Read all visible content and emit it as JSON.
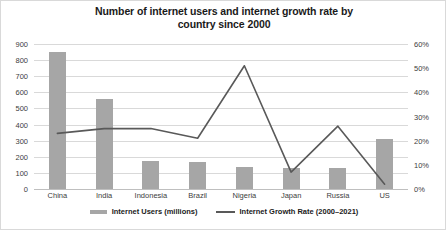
{
  "chart_data": {
    "type": "bar",
    "title": "Number of internet users and internet growth rate by country since 2000",
    "title_line1": "Number of internet users and internet growth rate by",
    "title_line2": "country since 2000",
    "categories": [
      "China",
      "India",
      "Indonesia",
      "Brazil",
      "Nigeria",
      "Japan",
      "Russia",
      "US"
    ],
    "series": [
      {
        "name": "Internet Users (millions)",
        "type": "bar",
        "axis": "left",
        "color": "#a6a6a6",
        "values": [
          850,
          560,
          175,
          165,
          135,
          130,
          130,
          310
        ]
      },
      {
        "name": "Internet Growth Rate (2000–2021)",
        "type": "line",
        "axis": "right",
        "color": "#595959",
        "values": [
          23,
          25,
          25,
          21,
          51,
          7,
          26,
          2
        ]
      }
    ],
    "xlabel": "",
    "ylabel": "",
    "ylim": [
      0,
      900
    ],
    "y_ticks": [
      "0",
      "100",
      "200",
      "300",
      "400",
      "500",
      "600",
      "700",
      "800",
      "900"
    ],
    "y2lim": [
      0,
      60
    ],
    "y2_ticks": [
      "0%",
      "10%",
      "20%",
      "30%",
      "40%",
      "50%",
      "60%"
    ],
    "grid": true,
    "legend_position": "bottom"
  },
  "legend": {
    "items": [
      {
        "label": "Internet Users (millions)"
      },
      {
        "label": "Internet Growth Rate (2000–2021)"
      }
    ]
  },
  "colors": {
    "bar": "#a6a6a6",
    "line": "#595959",
    "gridline": "#d9d9d9",
    "border": "#d9d9d9",
    "text": "#404040",
    "title": "#1a1a1a"
  }
}
